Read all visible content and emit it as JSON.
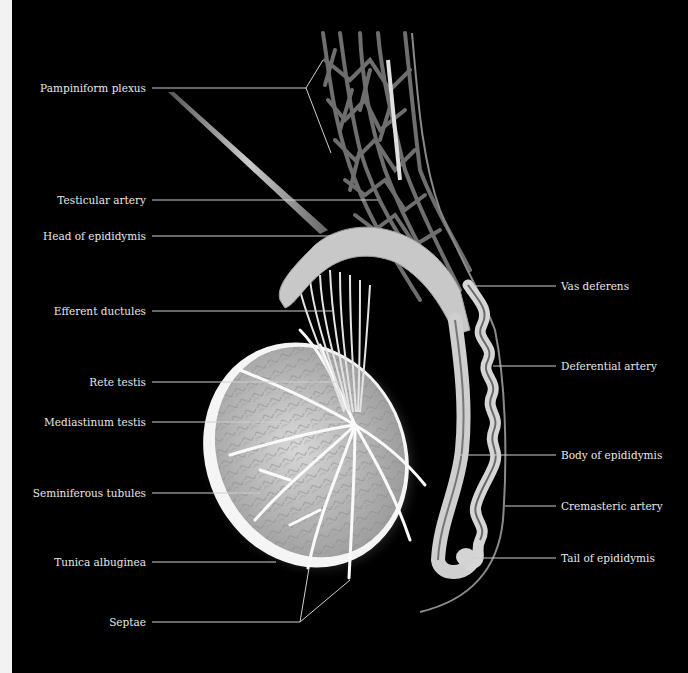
{
  "figure": {
    "background_color": "#000000",
    "label_color": "#e8e8e8",
    "leader_line_color": "#cfcfcf"
  },
  "labels": {
    "left": [
      {
        "id": "pampiniform",
        "text": "Pampiniform plexus"
      },
      {
        "id": "testicular_artery",
        "text": "Testicular artery"
      },
      {
        "id": "head_epididymis",
        "text": "Head of epididymis"
      },
      {
        "id": "efferent_ductules",
        "text": "Efferent ductules"
      },
      {
        "id": "rete_testis",
        "text": "Rete testis"
      },
      {
        "id": "mediastinum_testis",
        "text": "Mediastinum testis"
      },
      {
        "id": "seminiferous_tubules",
        "text": "Seminiferous tubules"
      },
      {
        "id": "tunica_albuginea",
        "text": "Tunica albuginea"
      },
      {
        "id": "septae",
        "text": "Septae"
      }
    ],
    "right": [
      {
        "id": "vas_deferens",
        "text": "Vas deferens"
      },
      {
        "id": "deferential_artery",
        "text": "Deferential artery"
      },
      {
        "id": "body_epididymis",
        "text": "Body of epididymis"
      },
      {
        "id": "cremasteric_artery",
        "text": "Cremasteric artery"
      },
      {
        "id": "tail_epididymis",
        "text": "Tail of epididymis"
      }
    ]
  }
}
